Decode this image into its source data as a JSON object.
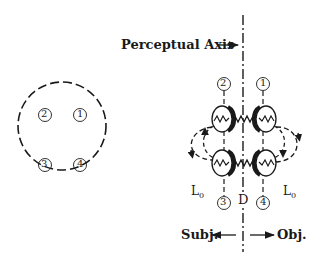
{
  "figure": {
    "left_panel": {
      "description": "dashed circle with four numbered positions",
      "nodes": [
        {
          "id": "2",
          "label": "②"
        },
        {
          "id": "1",
          "label": "①"
        },
        {
          "id": "3",
          "label": "③"
        },
        {
          "id": "4",
          "label": "④"
        }
      ]
    },
    "right_panel": {
      "axis_label": "Perceptual Axis",
      "axis_arrow": "→",
      "top_labels": {
        "left": "②",
        "right": "①"
      },
      "bottom_labels": {
        "left": "③",
        "center": "D",
        "right": "④"
      },
      "l0_left": "L",
      "l0_left_sub": "0",
      "l0_right": "L",
      "l0_right_sub": "0",
      "subj_label": "Subj.",
      "obj_label": "Obj."
    },
    "colors": {
      "ink": "#1a1a1a",
      "background": "#ffffff"
    }
  }
}
